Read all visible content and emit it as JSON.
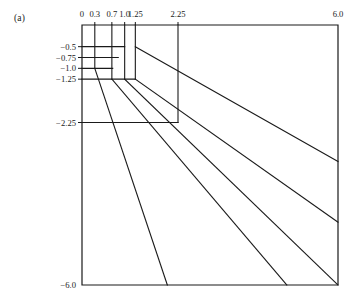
{
  "figure": {
    "panel_label": "(a)",
    "background_color": "#ffffff",
    "line_color": "#1a1a1a",
    "text_color": "#1a1a1a"
  },
  "chart_data": {
    "type": "line",
    "title": "",
    "subtitle": "",
    "xlabel": "",
    "ylabel": "",
    "grid": false,
    "legend": "none",
    "annotations": [
      "(a)"
    ],
    "axis_position": {
      "x_axis": "top",
      "y_axis": "left"
    },
    "xlim": [
      0,
      6.0
    ],
    "ylim": [
      -6.0,
      0
    ],
    "xticks": [
      0,
      0.3,
      0.7,
      1.0,
      1.25,
      2.25,
      6.0
    ],
    "xticklabels": [
      "0",
      "0.3",
      "0.7",
      "1.0",
      "1.25",
      "2.25",
      "6.0"
    ],
    "yticks": [
      -0.5,
      -0.75,
      -1.0,
      -1.25,
      -2.25,
      -6.0
    ],
    "yticklabels": [
      "−0.5",
      "−0.75",
      "−1.0",
      "−1.25",
      "−2.25",
      "−6.0"
    ],
    "series": [
      {
        "name": "frame",
        "kind": "rect-border",
        "points": [
          [
            0,
            0
          ],
          [
            6.0,
            0
          ],
          [
            6.0,
            -6.0
          ],
          [
            0,
            -6.0
          ],
          [
            0,
            0
          ]
        ]
      },
      {
        "name": "vertical-x-0.3",
        "kind": "polyline",
        "points": [
          [
            0.3,
            0
          ],
          [
            0.3,
            -1.0
          ]
        ]
      },
      {
        "name": "vertical-x-0.7",
        "kind": "polyline",
        "points": [
          [
            0.7,
            0
          ],
          [
            0.7,
            -1.25
          ]
        ]
      },
      {
        "name": "vertical-x-1.0",
        "kind": "polyline",
        "points": [
          [
            1.0,
            0
          ],
          [
            1.0,
            -1.25
          ]
        ]
      },
      {
        "name": "vertical-x-1.25",
        "kind": "polyline",
        "points": [
          [
            1.25,
            0
          ],
          [
            1.25,
            -1.25
          ]
        ]
      },
      {
        "name": "vertical-x-2.25",
        "kind": "polyline",
        "points": [
          [
            2.25,
            0
          ],
          [
            2.25,
            -2.25
          ]
        ]
      },
      {
        "name": "horizontal-y-0.5",
        "kind": "polyline",
        "points": [
          [
            0,
            -0.5
          ],
          [
            1.0,
            -0.5
          ]
        ]
      },
      {
        "name": "horizontal-y-0.75",
        "kind": "polyline",
        "points": [
          [
            0,
            -0.75
          ],
          [
            0.85,
            -0.75
          ]
        ]
      },
      {
        "name": "horizontal-y-1.0",
        "kind": "polyline",
        "points": [
          [
            0,
            -1.0
          ],
          [
            0.72,
            -1.0
          ]
        ]
      },
      {
        "name": "horizontal-y-1.25",
        "kind": "polyline",
        "points": [
          [
            0,
            -1.25
          ],
          [
            1.25,
            -1.25
          ]
        ]
      },
      {
        "name": "horizontal-y-2.25",
        "kind": "polyline",
        "points": [
          [
            0,
            -2.25
          ],
          [
            2.25,
            -2.25
          ]
        ]
      },
      {
        "name": "ray-1-to-bottom-left",
        "kind": "polyline",
        "points": [
          [
            0.3,
            -1.0
          ],
          [
            2.0,
            -6.0
          ]
        ]
      },
      {
        "name": "ray-2-to-bottom-mid",
        "kind": "polyline",
        "points": [
          [
            0.7,
            -1.25
          ],
          [
            4.8,
            -6.0
          ]
        ]
      },
      {
        "name": "ray-3-to-bottom-right-corner",
        "kind": "polyline",
        "points": [
          [
            1.0,
            -1.25
          ],
          [
            6.0,
            -6.0
          ]
        ]
      },
      {
        "name": "ray-4-to-right-edge-lower",
        "kind": "polyline",
        "points": [
          [
            1.25,
            -1.25
          ],
          [
            6.0,
            -4.55
          ]
        ]
      },
      {
        "name": "ray-5-to-right-edge-upper",
        "kind": "polyline",
        "points": [
          [
            1.25,
            -0.5
          ],
          [
            6.0,
            -3.15
          ]
        ]
      }
    ]
  },
  "axis_pixels": {
    "left": 82,
    "top": 25,
    "right": 338,
    "bottom": 285
  },
  "x_tick_labels": [
    {
      "text": "0",
      "x": 0
    },
    {
      "text": "0.3",
      "x": 0.3
    },
    {
      "text": "0.7",
      "x": 0.7
    },
    {
      "text": "1.0",
      "x": 1.0
    },
    {
      "text": "1.25",
      "x": 1.25
    },
    {
      "text": "2.25",
      "x": 2.25
    },
    {
      "text": "6.0",
      "x": 6.0
    }
  ],
  "y_tick_labels": [
    {
      "text": "−0.5",
      "y": -0.5
    },
    {
      "text": "−0.75",
      "y": -0.75
    },
    {
      "text": "−1.0",
      "y": -1.0
    },
    {
      "text": "−1.25",
      "y": -1.25
    },
    {
      "text": "−2.25",
      "y": -2.25
    },
    {
      "text": "−6.0",
      "y": -6.0
    }
  ]
}
